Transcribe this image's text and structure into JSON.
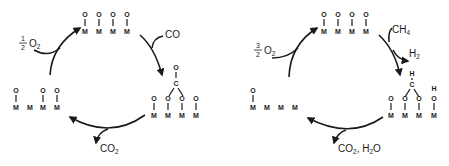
{
  "diagram": {
    "type": "catalytic-cycles",
    "cycles": [
      {
        "name": "co-oxidation-cycle",
        "top_state": {
          "sites": [
            "O-M",
            "O-M",
            "O-M",
            "O-M"
          ]
        },
        "reactant_in": {
          "label": "CO"
        },
        "adsorbed_state": {
          "sites": [
            "O-M",
            "O-M",
            "O-M",
            "O-M"
          ],
          "bridge": "C=O bridging two surface O"
        },
        "product_out": {
          "label": "CO",
          "subscript": "2"
        },
        "reduced_state": {
          "sites": [
            "O-M",
            "M",
            "O-M",
            "O-M"
          ]
        },
        "reoxidant": {
          "numerator": "1",
          "denominator": "2",
          "species": "O",
          "subscript": "2"
        }
      },
      {
        "name": "ch4-oxidation-cycle",
        "top_state": {
          "sites": [
            "O-M",
            "O-M",
            "O-M",
            "O-M"
          ]
        },
        "reactant_in": {
          "label": "CH",
          "subscript": "4"
        },
        "byproduct_out": {
          "label": "H",
          "subscript": "2"
        },
        "adsorbed_state": {
          "sites": [
            "O-M",
            "O-M",
            "O-M",
            "H-O-M"
          ],
          "bridge": "H-C bridging two surface O"
        },
        "product_out": {
          "label": "CO",
          "subscript": "2",
          "extra": "H",
          "extra_sub": "2",
          "extra_tail": "O"
        },
        "reduced_state": {
          "sites": [
            "O-M",
            "M",
            "M",
            "M"
          ]
        },
        "reoxidant": {
          "numerator": "3",
          "denominator": "2",
          "species": "O",
          "subscript": "2"
        }
      }
    ],
    "atoms": {
      "metal": "M",
      "oxygen": "O",
      "carbon": "C",
      "hydrogen": "H"
    }
  }
}
